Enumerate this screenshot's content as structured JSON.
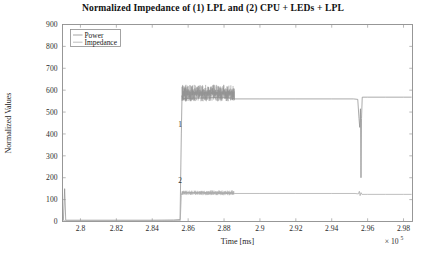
{
  "chart_data": {
    "type": "line",
    "title": "Normalized Impedance of (1) LPL and (2) CPU + LEDs + LPL",
    "xlabel": "Time [ms]",
    "ylabel": "Normalized Values",
    "x_multiplier": "× 10",
    "x_multiplier_exp": "5",
    "xlim": [
      2.79,
      2.985
    ],
    "ylim": [
      0,
      900
    ],
    "xticks": [
      2.8,
      2.82,
      2.84,
      2.86,
      2.88,
      2.9,
      2.92,
      2.94,
      2.96,
      2.98
    ],
    "xtick_labels": [
      "2.8",
      "2.82",
      "2.84",
      "2.86",
      "2.88",
      "2.9",
      "2.92",
      "2.94",
      "2.96",
      "2.98"
    ],
    "yticks": [
      0,
      100,
      200,
      300,
      400,
      500,
      600,
      700,
      800,
      900
    ],
    "ytick_labels": [
      "0",
      "100",
      "200",
      "300",
      "400",
      "500",
      "600",
      "700",
      "800",
      "900"
    ],
    "grid": false,
    "legend": {
      "position": "upper-left",
      "entries": [
        {
          "label": "Power",
          "color": "#9b9b9b"
        },
        {
          "label": "Impedance",
          "color": "#b4b4b4"
        }
      ]
    },
    "annotations": [
      {
        "text": "1",
        "x": 2.8555,
        "y": 430
      },
      {
        "text": "2",
        "x": 2.8555,
        "y": 175
      }
    ],
    "series": [
      {
        "name": "Power",
        "color": "#8f8f8f",
        "description": "Upper trace: near-zero baseline until 2.8565e5, steps up into a noisy band around 560-620, settles to a flat 562 plateau, brief dip and spike near 2.9565e5, then flat 568 to the end.",
        "points": [
          [
            2.7905,
            5
          ],
          [
            2.7912,
            150
          ],
          [
            2.7918,
            6
          ],
          [
            2.8,
            6
          ],
          [
            2.82,
            6
          ],
          [
            2.84,
            6
          ],
          [
            2.852,
            7
          ],
          [
            2.8555,
            9
          ],
          [
            2.8562,
            400
          ],
          [
            2.8566,
            575
          ],
          [
            2.857,
            562
          ],
          [
            2.876,
            566
          ],
          [
            2.884,
            564
          ],
          [
            2.8855,
            560
          ],
          [
            2.886,
            560
          ],
          [
            2.9,
            560
          ],
          [
            2.92,
            560
          ],
          [
            2.94,
            560
          ],
          [
            2.952,
            560
          ],
          [
            2.9545,
            558
          ],
          [
            2.9552,
            470
          ],
          [
            2.9556,
            430
          ],
          [
            2.956,
            515
          ],
          [
            2.9563,
            200
          ],
          [
            2.9566,
            470
          ],
          [
            2.957,
            568
          ],
          [
            2.96,
            568
          ],
          [
            2.97,
            568
          ],
          [
            2.98,
            568
          ],
          [
            2.9845,
            568
          ]
        ],
        "noise_bands": [
          {
            "x_start": 2.8566,
            "x_end": 2.8858,
            "y_min": 548,
            "y_max": 625,
            "n": 190
          }
        ]
      },
      {
        "name": "Impedance",
        "color": "#a8a8a8",
        "description": "Lower trace: flat near zero until 2.8565e5, jumps to a noisy band near 130, continues as a flat 128 plateau, small disturbance near 2.9555e5, then flat 124 to the end.",
        "points": [
          [
            2.7905,
            3
          ],
          [
            2.8,
            3
          ],
          [
            2.82,
            3
          ],
          [
            2.84,
            3
          ],
          [
            2.852,
            4
          ],
          [
            2.8556,
            4
          ],
          [
            2.8562,
            120
          ],
          [
            2.8566,
            132
          ],
          [
            2.876,
            130
          ],
          [
            2.885,
            129
          ],
          [
            2.8858,
            128
          ],
          [
            2.9,
            128
          ],
          [
            2.92,
            128
          ],
          [
            2.94,
            128
          ],
          [
            2.953,
            128
          ],
          [
            2.9548,
            126
          ],
          [
            2.9554,
            138
          ],
          [
            2.9558,
            118
          ],
          [
            2.9563,
            132
          ],
          [
            2.9568,
            124
          ],
          [
            2.96,
            124
          ],
          [
            2.97,
            124
          ],
          [
            2.98,
            124
          ],
          [
            2.9845,
            124
          ]
        ],
        "noise_bands": [
          {
            "x_start": 2.8566,
            "x_end": 2.8855,
            "y_min": 120,
            "y_max": 142,
            "n": 150
          }
        ]
      }
    ]
  }
}
